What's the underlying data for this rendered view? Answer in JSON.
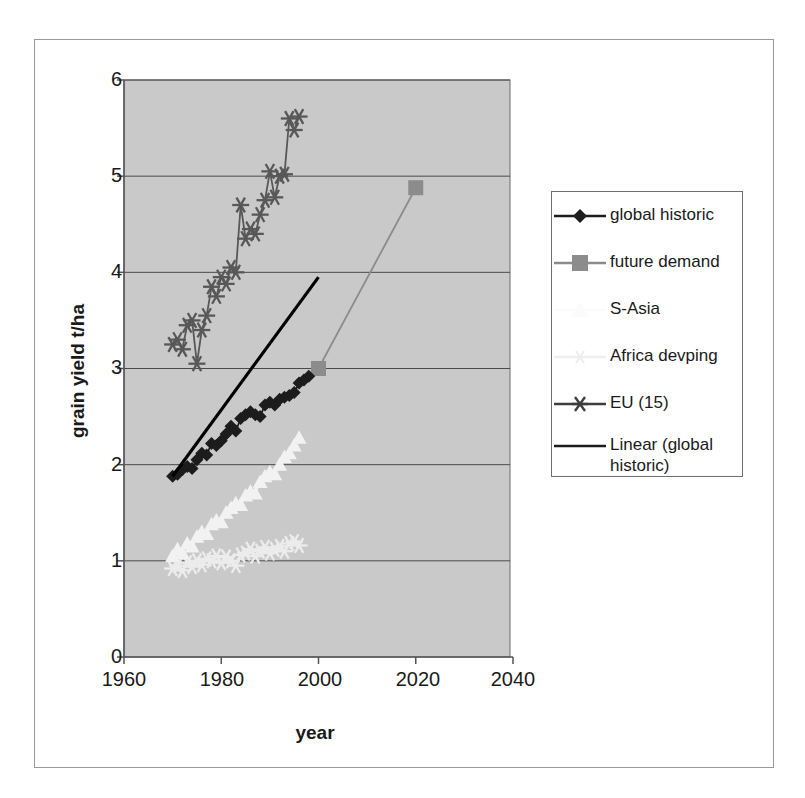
{
  "chart_data": {
    "type": "line",
    "title": "",
    "xlabel": "year",
    "ylabel": "grain yield t/ha",
    "xlim": [
      1960,
      2040
    ],
    "ylim": [
      0,
      6
    ],
    "xticks": [
      "1960",
      "1980",
      "2000",
      "2020",
      "2040"
    ],
    "yticks": [
      "0",
      "1",
      "2",
      "3",
      "4",
      "5",
      "6"
    ],
    "grid": "horizontal",
    "legend_position": "right",
    "plot_background": "#c9c9c9",
    "series": [
      {
        "name": "global historic",
        "color": "#1c1c1c",
        "marker": "diamond",
        "x": [
          1970,
          1971,
          1972,
          1973,
          1974,
          1975,
          1976,
          1977,
          1978,
          1979,
          1980,
          1981,
          1982,
          1983,
          1984,
          1985,
          1986,
          1987,
          1988,
          1989,
          1990,
          1991,
          1992,
          1993,
          1994,
          1995,
          1996,
          1997,
          1998
        ],
        "values": [
          1.88,
          1.9,
          1.95,
          1.98,
          1.96,
          2.05,
          2.12,
          2.1,
          2.22,
          2.2,
          2.25,
          2.32,
          2.4,
          2.35,
          2.48,
          2.52,
          2.55,
          2.52,
          2.5,
          2.62,
          2.65,
          2.62,
          2.68,
          2.7,
          2.72,
          2.75,
          2.85,
          2.88,
          2.92
        ]
      },
      {
        "name": "future demand",
        "color": "#8c8c8c",
        "marker": "square",
        "x": [
          2000,
          2020
        ],
        "values": [
          3.0,
          4.88
        ]
      },
      {
        "name": "S-Asia",
        "color": "#f2f2f2",
        "marker": "triangle",
        "x": [
          1970,
          1971,
          1972,
          1973,
          1974,
          1975,
          1976,
          1977,
          1978,
          1979,
          1980,
          1981,
          1982,
          1983,
          1984,
          1985,
          1986,
          1987,
          1988,
          1989,
          1990,
          1991,
          1992,
          1993,
          1994,
          1995,
          1996
        ],
        "values": [
          1.05,
          1.12,
          1.08,
          1.18,
          1.15,
          1.25,
          1.3,
          1.28,
          1.38,
          1.42,
          1.4,
          1.5,
          1.55,
          1.6,
          1.58,
          1.68,
          1.72,
          1.7,
          1.82,
          1.88,
          1.92,
          1.9,
          2.0,
          2.08,
          2.12,
          2.2,
          2.28
        ]
      },
      {
        "name": "Africa  devping",
        "color": "#ececec",
        "marker": "asterisk",
        "x": [
          1970,
          1971,
          1972,
          1973,
          1974,
          1975,
          1976,
          1977,
          1978,
          1979,
          1980,
          1981,
          1982,
          1983,
          1984,
          1985,
          1986,
          1987,
          1988,
          1989,
          1990,
          1991,
          1992,
          1993,
          1994,
          1995,
          1996
        ],
        "values": [
          0.92,
          0.95,
          0.9,
          0.98,
          0.94,
          1.0,
          0.96,
          1.02,
          1.0,
          1.05,
          0.98,
          1.04,
          1.0,
          0.95,
          1.06,
          1.08,
          1.12,
          1.05,
          1.1,
          1.14,
          1.08,
          1.12,
          1.15,
          1.1,
          1.18,
          1.2,
          1.16
        ]
      },
      {
        "name": "EU (15)",
        "color": "#585858",
        "marker": "asterisk",
        "x": [
          1970,
          1971,
          1972,
          1973,
          1974,
          1975,
          1976,
          1977,
          1978,
          1979,
          1980,
          1981,
          1982,
          1983,
          1984,
          1985,
          1986,
          1987,
          1988,
          1989,
          1990,
          1991,
          1992,
          1993,
          1994,
          1995,
          1996
        ],
        "values": [
          3.25,
          3.3,
          3.2,
          3.45,
          3.5,
          3.05,
          3.4,
          3.55,
          3.85,
          3.75,
          3.95,
          3.88,
          4.05,
          4.0,
          4.7,
          4.35,
          4.45,
          4.4,
          4.6,
          4.75,
          5.05,
          4.78,
          5.0,
          5.02,
          5.6,
          5.48,
          5.62
        ]
      },
      {
        "name": "Linear (global historic)",
        "color": "#000000",
        "marker": "none",
        "trendline": true,
        "x": [
          1970,
          2000
        ],
        "values": [
          1.88,
          3.95
        ]
      }
    ]
  },
  "axes": {
    "x_title": "year",
    "y_title": "grain yield t/ha"
  },
  "legend": {
    "items": [
      {
        "label": "global historic",
        "key": "diamond-line-black"
      },
      {
        "label": "future demand",
        "key": "square-line-gray"
      },
      {
        "label": "S-Asia",
        "key": "triangle-line-white"
      },
      {
        "label": "Africa  devping",
        "key": "asterisk-line-white"
      },
      {
        "label": "EU (15)",
        "key": "asterisk-line-darkgray"
      },
      {
        "label": "Linear (global historic)",
        "key": "plain-line-black"
      }
    ]
  },
  "ticks": {
    "y": [
      "6",
      "5",
      "4",
      "3",
      "2",
      "1",
      "0"
    ],
    "x": [
      "1960",
      "1980",
      "2000",
      "2020",
      "2040"
    ]
  }
}
